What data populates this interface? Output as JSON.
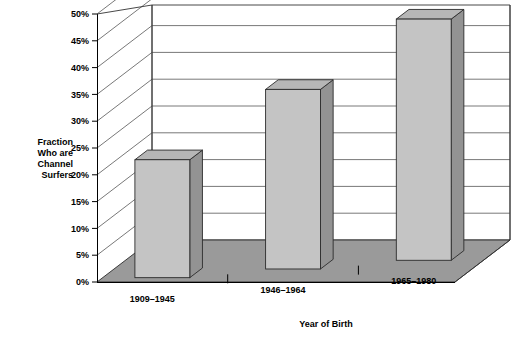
{
  "chart_data": {
    "type": "bar",
    "title": "",
    "subtitle": "",
    "xlabel": "Year of Birth",
    "ylabel": "Fraction Who are Channel Surfers",
    "ylabel_lines": [
      "Fraction",
      "Who are",
      "Channel",
      "Surfers"
    ],
    "categories": [
      "1909–1945",
      "1946–1964",
      "1965–1980"
    ],
    "values": [
      22,
      33.5,
      45
    ],
    "value_labels": [
      "22%",
      "33.5%",
      "45%"
    ],
    "ylim": [
      0,
      50
    ],
    "ytick_step": 5,
    "ytick_labels": [
      "0%",
      "5%",
      "10%",
      "15%",
      "20%",
      "25%",
      "30%",
      "35%",
      "40%",
      "45%",
      "50%"
    ],
    "ytick_values": [
      0,
      5,
      10,
      15,
      20,
      25,
      30,
      35,
      40,
      45,
      50
    ],
    "grid": true,
    "grid_axis": "y",
    "legend": false,
    "legend_position": "none",
    "projection": "3d",
    "series": [
      {
        "name": "Fraction Who are Channel Surfers",
        "values": [
          22,
          33.5,
          45
        ]
      }
    ]
  },
  "colors": {
    "bar_front": "#c4c4c4",
    "bar_side": "#939393",
    "bar_top": "#b6b6b6",
    "floor": "#9a9a9a",
    "wall": "#ffffff",
    "outline": "#2b2b2b",
    "grid": "#555555",
    "text": "#000000",
    "background": "#ffffff"
  }
}
